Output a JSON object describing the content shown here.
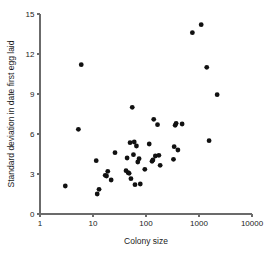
{
  "chart_data": {
    "type": "scatter",
    "title": "",
    "xlabel": "Colony size",
    "ylabel": "Standard deviation in date first egg laid",
    "xscale": "log",
    "yscale": "linear",
    "xlim": [
      1,
      10000
    ],
    "ylim": [
      0,
      15
    ],
    "xticks": [
      1,
      10,
      100,
      1000,
      10000
    ],
    "xtick_labels": [
      "1",
      "10",
      "100",
      "1000",
      "10000"
    ],
    "yticks": [
      0,
      3,
      6,
      9,
      12,
      15
    ],
    "ytick_labels": [
      "0",
      "3",
      "6",
      "9",
      "12",
      "15"
    ],
    "grid": false,
    "legend": false,
    "marker": "filled-circle",
    "marker_color": "#111111",
    "points": [
      {
        "x": 3.0,
        "y": 2.1
      },
      {
        "x": 5.3,
        "y": 6.35
      },
      {
        "x": 6.0,
        "y": 11.2
      },
      {
        "x": 11.5,
        "y": 4.0
      },
      {
        "x": 12.0,
        "y": 1.5
      },
      {
        "x": 13.0,
        "y": 1.85
      },
      {
        "x": 17.0,
        "y": 2.9
      },
      {
        "x": 18.0,
        "y": 2.85
      },
      {
        "x": 19.0,
        "y": 3.2
      },
      {
        "x": 22.0,
        "y": 2.55
      },
      {
        "x": 26.0,
        "y": 4.6
      },
      {
        "x": 42.0,
        "y": 3.25
      },
      {
        "x": 44.0,
        "y": 4.2
      },
      {
        "x": 46.0,
        "y": 3.1
      },
      {
        "x": 48.0,
        "y": 3.05
      },
      {
        "x": 50.0,
        "y": 5.35
      },
      {
        "x": 52.0,
        "y": 2.65
      },
      {
        "x": 55.0,
        "y": 8.0
      },
      {
        "x": 58.0,
        "y": 4.45
      },
      {
        "x": 60.0,
        "y": 5.4
      },
      {
        "x": 62.0,
        "y": 2.2
      },
      {
        "x": 66.0,
        "y": 5.1
      },
      {
        "x": 70.0,
        "y": 3.9
      },
      {
        "x": 74.0,
        "y": 4.15
      },
      {
        "x": 78.0,
        "y": 2.25
      },
      {
        "x": 95.0,
        "y": 3.35
      },
      {
        "x": 115.0,
        "y": 5.25
      },
      {
        "x": 130.0,
        "y": 3.95
      },
      {
        "x": 135.0,
        "y": 4.05
      },
      {
        "x": 140.0,
        "y": 7.1
      },
      {
        "x": 150.0,
        "y": 4.35
      },
      {
        "x": 165.0,
        "y": 6.7
      },
      {
        "x": 175.0,
        "y": 4.4
      },
      {
        "x": 185.0,
        "y": 3.65
      },
      {
        "x": 330.0,
        "y": 4.1
      },
      {
        "x": 340.0,
        "y": 5.05
      },
      {
        "x": 355.0,
        "y": 6.65
      },
      {
        "x": 370.0,
        "y": 6.8
      },
      {
        "x": 400.0,
        "y": 4.8
      },
      {
        "x": 480.0,
        "y": 6.75
      },
      {
        "x": 750.0,
        "y": 13.6
      },
      {
        "x": 1100.0,
        "y": 14.2
      },
      {
        "x": 1400.0,
        "y": 11.0
      },
      {
        "x": 1550.0,
        "y": 5.5
      },
      {
        "x": 2200.0,
        "y": 8.95
      }
    ]
  },
  "geometry": {
    "plot_left": 40,
    "plot_right": 252,
    "plot_top": 14,
    "plot_bottom": 214,
    "marker_radius": 2.4
  }
}
